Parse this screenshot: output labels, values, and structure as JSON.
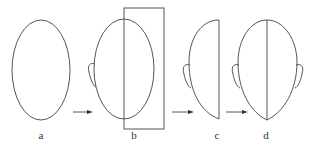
{
  "figure": {
    "panels": [
      {
        "id": "a",
        "label": "a",
        "description": "plain oval outline"
      },
      {
        "id": "b",
        "label": "b",
        "description": "oval with left ear, rectangle over right half"
      },
      {
        "id": "c",
        "label": "c",
        "description": "left half-face with ear"
      },
      {
        "id": "d",
        "label": "d",
        "description": "full mirrored face with both ears and center line"
      }
    ],
    "stroke_color": "#555555",
    "background": "#ffffff"
  }
}
